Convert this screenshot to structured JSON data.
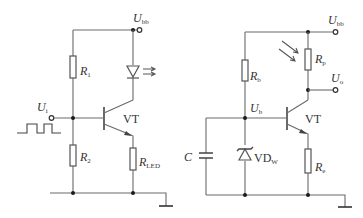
{
  "left_circuit": {
    "supply_label": "U",
    "supply_sub": "bb",
    "input_label": "U",
    "input_sub": "i",
    "r1_label": "R",
    "r1_sub": "1",
    "r2_label": "R",
    "r2_sub": "2",
    "rled_label": "R",
    "rled_sub": "LED",
    "transistor_label": "VT"
  },
  "right_circuit": {
    "supply_label": "U",
    "supply_sub": "bb",
    "output_label": "U",
    "output_sub": "o",
    "base_label": "U",
    "base_sub": "b",
    "rb_label": "R",
    "rb_sub": "b",
    "rp_label": "R",
    "rp_sub": "p",
    "re_label": "R",
    "re_sub": "e",
    "capacitor_label": "C",
    "zener_label": "VD",
    "zener_sub": "W",
    "transistor_label": "VT"
  }
}
